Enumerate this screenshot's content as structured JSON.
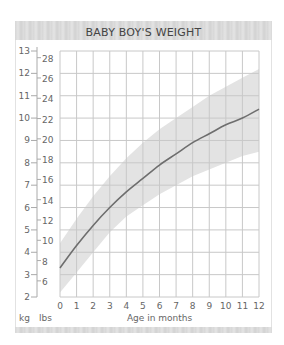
{
  "title": "BABY BOY'S WEIGHT",
  "axis": {
    "left_unit": "kg",
    "right_unit": "lbs",
    "xlabel": "Age in months",
    "kg_ticks": [
      "13",
      "12",
      "11",
      "10",
      "9",
      "8",
      "7",
      "6",
      "5",
      "4",
      "3",
      "2"
    ],
    "lbs_ticks": [
      "28",
      "26",
      "24",
      "22",
      "20",
      "18",
      "16",
      "14",
      "12",
      "10",
      "8",
      "6"
    ],
    "x_ticks": [
      "0",
      "1",
      "2",
      "3",
      "4",
      "5",
      "6",
      "7",
      "8",
      "9",
      "10",
      "11",
      "12"
    ]
  },
  "colors": {
    "band": "#e3e3e3",
    "curve": "#6e6e6e",
    "grid": "#c8c8c8",
    "header": "#dcdcdc"
  },
  "chart_data": {
    "type": "line",
    "title": "BABY BOY'S WEIGHT",
    "xlabel": "Age in months",
    "ylabel": "kg / lbs",
    "x": [
      0,
      1,
      2,
      3,
      4,
      5,
      6,
      7,
      8,
      9,
      10,
      11,
      12
    ],
    "series": [
      {
        "name": "Average weight (kg)",
        "values": [
          3.3,
          4.3,
          5.2,
          6.0,
          6.7,
          7.3,
          7.9,
          8.4,
          8.9,
          9.3,
          9.7,
          10.0,
          10.4
        ]
      },
      {
        "name": "Normal range upper (kg)",
        "values": [
          4.4,
          5.5,
          6.5,
          7.4,
          8.2,
          8.9,
          9.5,
          10.0,
          10.5,
          11.0,
          11.4,
          11.8,
          12.2
        ]
      },
      {
        "name": "Normal range lower (kg)",
        "values": [
          2.2,
          3.1,
          4.0,
          4.9,
          5.6,
          6.1,
          6.6,
          7.0,
          7.4,
          7.7,
          8.0,
          8.3,
          8.5
        ]
      }
    ],
    "xlim": [
      0,
      12
    ],
    "ylim_kg": [
      2,
      13
    ],
    "ylim_lbs": [
      4.4,
      28.7
    ],
    "grid": true,
    "legend": "none"
  }
}
